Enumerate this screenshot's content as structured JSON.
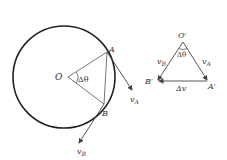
{
  "diagram": {
    "colors": {
      "stroke": "#222222",
      "thin": "#555555",
      "text": "#333333"
    },
    "circle": {
      "center_label": "O",
      "angle_label": "Δθ",
      "point_a_label": "A",
      "point_b_label": "B",
      "velocity_a": {
        "symbol": "v",
        "subscript": "A"
      },
      "velocity_b": {
        "symbol": "v",
        "subscript": "B"
      }
    },
    "triangle": {
      "apex_label": "O′",
      "angle_label": "Δθ",
      "vertex_a_label": "A′",
      "vertex_b_label": "B′",
      "side_a": {
        "symbol": "v",
        "subscript": "A"
      },
      "side_b": {
        "symbol": "v",
        "subscript": "B"
      },
      "delta_label": "Δv"
    }
  }
}
